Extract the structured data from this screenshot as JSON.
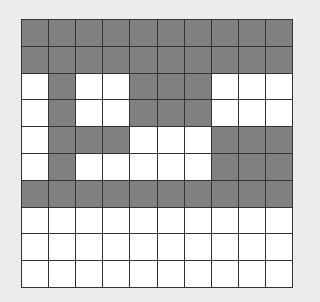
{
  "grid": {
    "rows": 10,
    "cols": 10,
    "colors": {
      "filled": "#808080",
      "empty": "#ffffff",
      "line": "#333333",
      "background": "#ececec"
    },
    "cells": [
      [
        1,
        1,
        1,
        1,
        1,
        1,
        1,
        1,
        1,
        1
      ],
      [
        1,
        1,
        1,
        1,
        1,
        1,
        1,
        1,
        1,
        1
      ],
      [
        0,
        1,
        0,
        0,
        1,
        1,
        1,
        0,
        0,
        0
      ],
      [
        0,
        1,
        0,
        0,
        1,
        1,
        1,
        0,
        0,
        0
      ],
      [
        0,
        1,
        1,
        1,
        0,
        0,
        0,
        1,
        1,
        1
      ],
      [
        0,
        1,
        0,
        0,
        0,
        0,
        0,
        1,
        1,
        1
      ],
      [
        1,
        1,
        1,
        1,
        1,
        1,
        1,
        1,
        1,
        1
      ],
      [
        0,
        0,
        0,
        0,
        0,
        0,
        0,
        0,
        0,
        0
      ],
      [
        0,
        0,
        0,
        0,
        0,
        0,
        0,
        0,
        0,
        0
      ],
      [
        0,
        0,
        0,
        0,
        0,
        0,
        0,
        0,
        0,
        0
      ]
    ]
  }
}
